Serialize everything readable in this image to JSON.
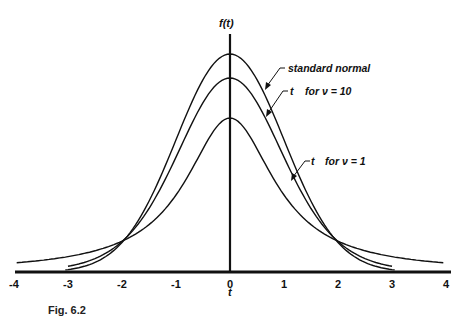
{
  "chart_data": {
    "type": "line",
    "title": "",
    "xlabel": "t",
    "ylabel": "f(t)",
    "xlim": [
      -4,
      4
    ],
    "ylim": [
      0,
      0.42
    ],
    "grid": false,
    "x_ticks": [
      "-4",
      "-3",
      "-2",
      "-1",
      "0",
      "1",
      "2",
      "3",
      "4"
    ],
    "series": [
      {
        "name": "standard normal",
        "distribution": "normal",
        "peak": 0.399,
        "x": [
          -4,
          -3,
          -2,
          -1,
          0,
          1,
          2,
          3,
          4
        ],
        "values": [
          0.0,
          0.004,
          0.054,
          0.242,
          0.399,
          0.242,
          0.054,
          0.004,
          0.0
        ]
      },
      {
        "name": "t for ν = 10",
        "distribution": "t",
        "df": 10,
        "peak": 0.389,
        "x": [
          -4,
          -3,
          -2,
          -1,
          0,
          1,
          2,
          3,
          4
        ],
        "values": [
          0.002,
          0.011,
          0.061,
          0.23,
          0.389,
          0.23,
          0.061,
          0.011,
          0.002
        ]
      },
      {
        "name": "t for ν = 1",
        "distribution": "t",
        "df": 1,
        "peak": 0.318,
        "x": [
          -4,
          -3,
          -2,
          -1,
          0,
          1,
          2,
          3,
          4
        ],
        "values": [
          0.019,
          0.032,
          0.064,
          0.159,
          0.318,
          0.159,
          0.064,
          0.032,
          0.019
        ]
      }
    ],
    "annotations": [
      "standard normal",
      "t for ν = 10",
      "t for ν = 1"
    ],
    "legend": "none (curves labeled with arrows)"
  },
  "labels": {
    "y_axis": "f(t)",
    "x_axis": "t",
    "normal": "standard   normal",
    "t10_t": "t",
    "t10_rest": "for  ν = 10",
    "t1_t": "t",
    "t1_rest": "for  ν = 1"
  },
  "caption": "Fig. 6.2"
}
